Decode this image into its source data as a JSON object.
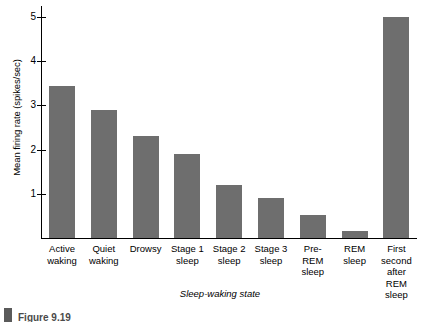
{
  "chart_data": {
    "type": "bar",
    "title": "",
    "xlabel": "Sleep-waking state",
    "ylabel": "Mean firing rate (spikes/sec)",
    "categories": [
      "Active\nwaking",
      "Quiet\nwaking",
      "Drowsy",
      "Stage 1\nsleep",
      "Stage 2\nsleep",
      "Stage 3\nsleep",
      "Pre-\nREM\nsleep",
      "REM\nsleep",
      "First\nsecond\nafter\nREM\nsleep"
    ],
    "values": [
      3.45,
      2.9,
      2.3,
      1.9,
      1.2,
      0.9,
      0.52,
      0.15,
      5.0
    ],
    "ylim": [
      0,
      5.25
    ],
    "yticks": [
      1,
      2,
      3,
      4,
      5
    ],
    "ytick_labels": [
      "1",
      "2",
      "3",
      "4",
      "5"
    ],
    "grid": false,
    "legend": false,
    "bar_color": "#6e6e6e",
    "axis_color": "#000000"
  },
  "caption": {
    "label": "Figure  9.19"
  }
}
